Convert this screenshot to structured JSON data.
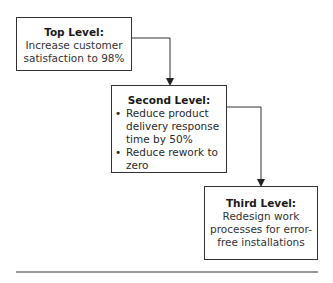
{
  "levels": [
    {
      "title": "Top Level:",
      "text": "Increase customer satisfaction to 98%"
    },
    {
      "title": "Second Level:",
      "bullets": [
        "Reduce product delivery response time by 50%",
        "Reduce rework to zero"
      ]
    },
    {
      "title": "Third Level:",
      "text": "Redesign work processes for error-free installations"
    }
  ]
}
